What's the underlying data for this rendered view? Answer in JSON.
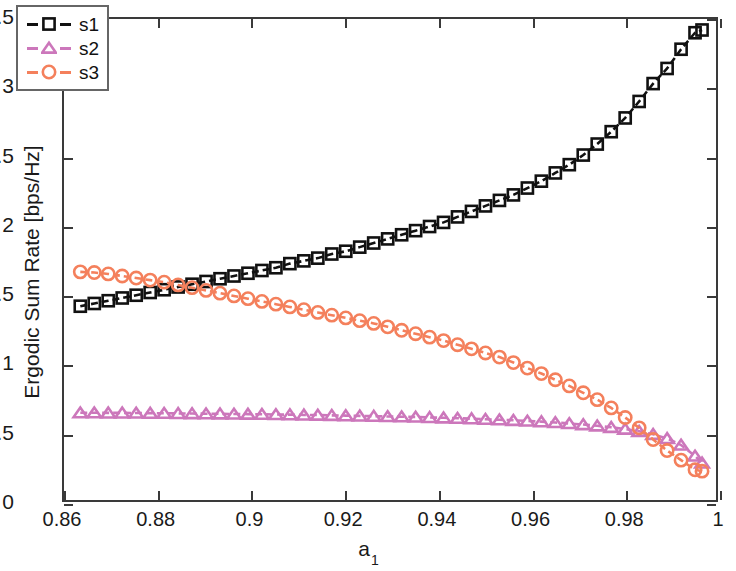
{
  "chart_data": {
    "type": "line",
    "title": "",
    "xlabel": "a_1",
    "xlabel_base": "a",
    "xlabel_sub": "1",
    "ylabel": "Ergodic Sum Rate [bps/Hz]",
    "xlim": [
      0.86,
      1.0
    ],
    "ylim": [
      0,
      3.5
    ],
    "xticks": [
      0.86,
      0.88,
      0.9,
      0.92,
      0.94,
      0.96,
      0.98,
      1
    ],
    "xtick_labels": [
      "0.86",
      "0.88",
      "0.9",
      "0.92",
      "0.94",
      "0.96",
      "0.98",
      "1"
    ],
    "yticks": [
      0,
      0.5,
      1,
      1.5,
      2,
      2.5,
      3,
      3.5
    ],
    "ytick_labels": [
      "0",
      "0.5",
      "1",
      "1.5",
      "2",
      "2.5",
      "3",
      "3.5"
    ],
    "grid": false,
    "legend_position": "top-left",
    "linestyle": "dashed",
    "x": [
      0.8635,
      0.8665,
      0.8695,
      0.8725,
      0.8755,
      0.8785,
      0.8815,
      0.8845,
      0.8875,
      0.8905,
      0.8935,
      0.8965,
      0.8995,
      0.9025,
      0.9055,
      0.9085,
      0.9115,
      0.9145,
      0.9175,
      0.9205,
      0.9235,
      0.9265,
      0.9295,
      0.9325,
      0.9355,
      0.9385,
      0.9415,
      0.9445,
      0.9475,
      0.9505,
      0.9535,
      0.9565,
      0.9595,
      0.9625,
      0.9655,
      0.9685,
      0.9715,
      0.9745,
      0.9775,
      0.9805,
      0.9835,
      0.9865,
      0.9895,
      0.9925,
      0.9955,
      0.997
    ],
    "series": [
      {
        "name": "s1",
        "color": "#111111",
        "marker": "square",
        "values": [
          1.41,
          1.43,
          1.45,
          1.47,
          1.49,
          1.51,
          1.53,
          1.55,
          1.57,
          1.59,
          1.61,
          1.63,
          1.65,
          1.67,
          1.69,
          1.72,
          1.74,
          1.76,
          1.79,
          1.81,
          1.84,
          1.87,
          1.9,
          1.93,
          1.96,
          1.99,
          2.02,
          2.06,
          2.1,
          2.14,
          2.18,
          2.22,
          2.27,
          2.32,
          2.38,
          2.44,
          2.51,
          2.59,
          2.68,
          2.78,
          2.9,
          3.03,
          3.14,
          3.28,
          3.4,
          3.42
        ]
      },
      {
        "name": "s2",
        "color": "#CC77BB",
        "marker": "triangle",
        "values": [
          0.635,
          0.635,
          0.634,
          0.634,
          0.633,
          0.632,
          0.631,
          0.63,
          0.629,
          0.628,
          0.627,
          0.626,
          0.625,
          0.624,
          0.622,
          0.621,
          0.619,
          0.618,
          0.616,
          0.614,
          0.612,
          0.61,
          0.608,
          0.606,
          0.604,
          0.601,
          0.598,
          0.595,
          0.592,
          0.588,
          0.584,
          0.58,
          0.575,
          0.57,
          0.564,
          0.557,
          0.549,
          0.54,
          0.529,
          0.516,
          0.5,
          0.478,
          0.448,
          0.4,
          0.32,
          0.27
        ]
      },
      {
        "name": "s3",
        "color": "#F4805C",
        "marker": "circle",
        "values": [
          1.66,
          1.655,
          1.645,
          1.63,
          1.615,
          1.6,
          1.585,
          1.565,
          1.545,
          1.525,
          1.505,
          1.485,
          1.465,
          1.445,
          1.425,
          1.405,
          1.385,
          1.365,
          1.345,
          1.325,
          1.305,
          1.285,
          1.26,
          1.235,
          1.21,
          1.185,
          1.16,
          1.13,
          1.1,
          1.07,
          1.04,
          1.0,
          0.96,
          0.92,
          0.875,
          0.83,
          0.78,
          0.73,
          0.67,
          0.6,
          0.525,
          0.44,
          0.36,
          0.29,
          0.22,
          0.21
        ]
      }
    ]
  },
  "legend": {
    "entries": [
      {
        "label": "s1"
      },
      {
        "label": "s2"
      },
      {
        "label": "s3"
      }
    ]
  }
}
